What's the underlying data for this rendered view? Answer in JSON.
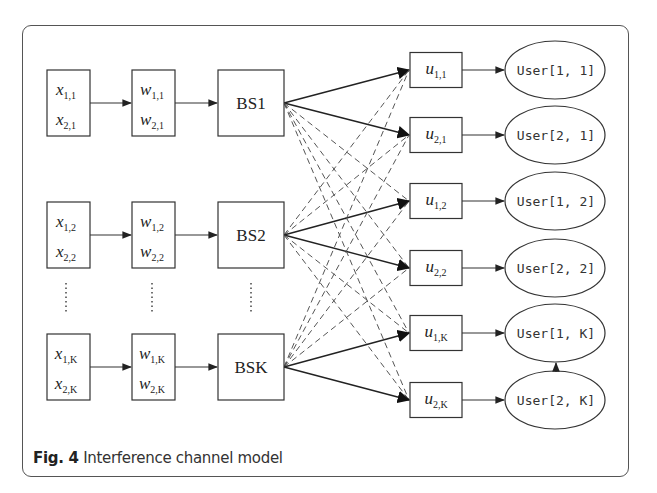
{
  "figure": {
    "caption_prefix": "Fig. 4",
    "caption_text": " Interference channel model"
  },
  "rows": [
    {
      "x_top": "x",
      "x_top_sub": "1,1",
      "x_bot": "x",
      "x_bot_sub": "2,1",
      "w_top": "w",
      "w_top_sub": "1,1",
      "w_bot": "w",
      "w_bot_sub": "2,1",
      "bs": "BS1",
      "cy": 103
    },
    {
      "x_top": "x",
      "x_top_sub": "1,2",
      "x_bot": "x",
      "x_bot_sub": "2,2",
      "w_top": "w",
      "w_top_sub": "1,2",
      "w_bot": "w",
      "w_bot_sub": "2,2",
      "bs": "BS2",
      "cy": 235
    },
    {
      "x_top": "x",
      "x_top_sub": "1,K",
      "x_bot": "x",
      "x_bot_sub": "2,K",
      "w_top": "w",
      "w_top_sub": "1,K",
      "w_bot": "w",
      "w_bot_sub": "2,K",
      "bs": "BSK",
      "cy": 367
    }
  ],
  "ellipsis": "⋮",
  "receivers": [
    {
      "u": "u",
      "u_sub": "1,1",
      "user": "User[1, 1]",
      "cy": 70
    },
    {
      "u": "u",
      "u_sub": "2,1",
      "user": "User[2, 1]",
      "cy": 135
    },
    {
      "u": "u",
      "u_sub": "1,2",
      "user": "User[1, 2]",
      "cy": 201
    },
    {
      "u": "u",
      "u_sub": "2,2",
      "user": "User[2, 2]",
      "cy": 268
    },
    {
      "u": "u",
      "u_sub": "1,K",
      "user": "User[1, K]",
      "cy": 333
    },
    {
      "u": "u",
      "u_sub": "2,K",
      "user": "User[2, K]",
      "cy": 400
    }
  ],
  "colors": {
    "stroke": "#333333",
    "dashed": "#555555",
    "background": "#ffffff"
  }
}
